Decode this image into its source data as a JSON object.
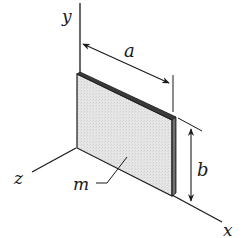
{
  "diagram": {
    "type": "3D thin rectangular plate with coordinate axes",
    "axes": {
      "x_label": "x",
      "y_label": "y",
      "z_label": "z"
    },
    "dimensions": {
      "width_label": "a",
      "height_label": "b"
    },
    "mass_label": "m",
    "colors": {
      "line": "#1a1a1a",
      "plate_fill": "#e4e4e4",
      "plate_edge": "#3a3a3a",
      "background": "#ffffff"
    }
  }
}
